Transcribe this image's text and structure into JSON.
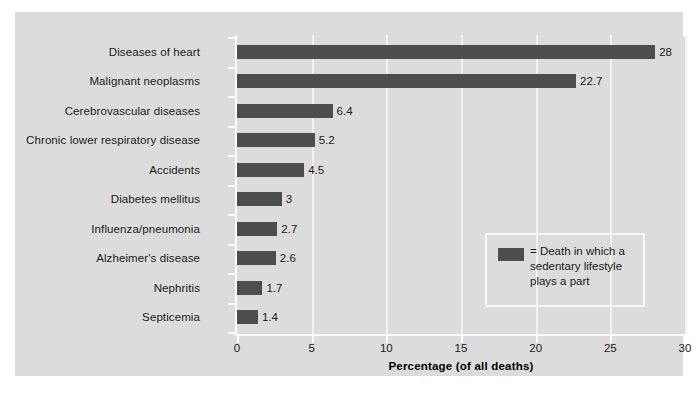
{
  "chart_data": {
    "type": "bar",
    "orientation": "horizontal",
    "title": "",
    "xlabel": "Percentage (of all deaths)",
    "ylabel": "",
    "xlim": [
      0,
      30
    ],
    "xticks": [
      0,
      5,
      10,
      15,
      20,
      25,
      30
    ],
    "xticklabels": [
      "0",
      "5",
      "10",
      "15",
      "20",
      "25",
      "30"
    ],
    "grid": "vertical",
    "legend_position": "inside-lower-right",
    "bar_color": "#4d4d4d",
    "panel_background": "#dcdcdc",
    "gridline_color": "#f2f2f2",
    "categories": [
      "Diseases of heart",
      "Malignant neoplasms",
      "Cerebrovascular diseases",
      "Chronic lower respiratory disease",
      "Accidents",
      "Diabetes mellitus",
      "Influenza/pneumonia",
      "Alzheimer's disease",
      "Nephritis",
      "Septicemia"
    ],
    "values": [
      28,
      22.7,
      6.4,
      5.2,
      4.5,
      3,
      2.7,
      2.6,
      1.7,
      1.4
    ],
    "value_labels": [
      "28",
      "22.7",
      "6.4",
      "5.2",
      "4.5",
      "3",
      "2.7",
      "2.6",
      "1.7",
      "1.4"
    ]
  },
  "legend": {
    "swatch_color": "#4d4d4d",
    "text": "= Death in which a sedentary lifestyle plays a part"
  }
}
